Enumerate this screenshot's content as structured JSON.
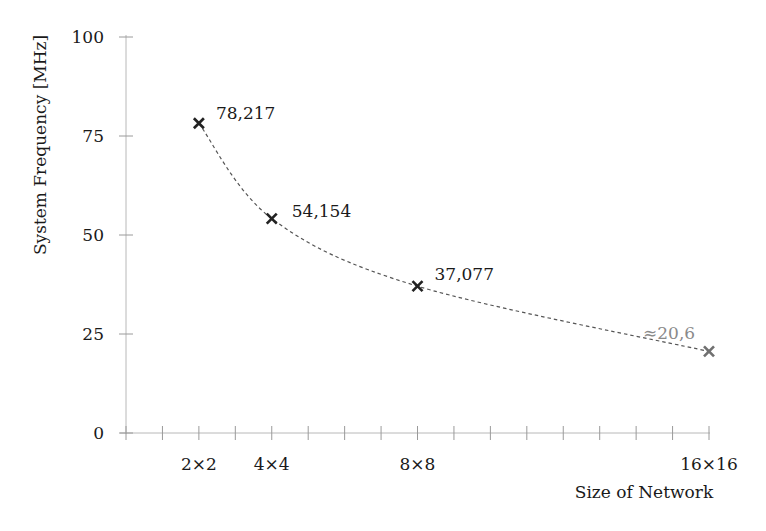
{
  "chart_data": {
    "type": "line",
    "title": "",
    "xlabel": "Size of Network",
    "ylabel": "System Frequency [MHz]",
    "ylim": [
      0,
      100
    ],
    "xlim": [
      0,
      16
    ],
    "grid": false,
    "legend": null,
    "y_ticks": [
      "0",
      "25",
      "50",
      "75",
      "100"
    ],
    "x_tick_labels": [
      {
        "pos": 2,
        "label": "2×2"
      },
      {
        "pos": 4,
        "label": "4×4"
      },
      {
        "pos": 8,
        "label": "8×8"
      },
      {
        "pos": 16,
        "label": "16×16"
      }
    ],
    "x_minor_ticks": [
      0,
      1,
      2,
      3,
      4,
      5,
      6,
      7,
      8,
      9,
      10,
      11,
      12,
      13,
      14,
      15,
      16
    ],
    "categories": [
      "2×2",
      "4×4",
      "8×8",
      "16×16"
    ],
    "x": [
      2,
      4,
      8,
      16
    ],
    "series": [
      {
        "name": "System Frequency",
        "values": [
          78.217,
          54.154,
          37.077,
          20.6
        ],
        "labels": [
          "78,217",
          "54,154",
          "37,077",
          "≈20,6"
        ],
        "estimated": [
          false,
          false,
          false,
          true
        ],
        "line_style": "dashed",
        "marker": "x"
      }
    ],
    "colors": {
      "marker": "#222222",
      "estimated": "#8a8a8a",
      "curve": "#555555",
      "axis": "#b8b8b8"
    }
  }
}
